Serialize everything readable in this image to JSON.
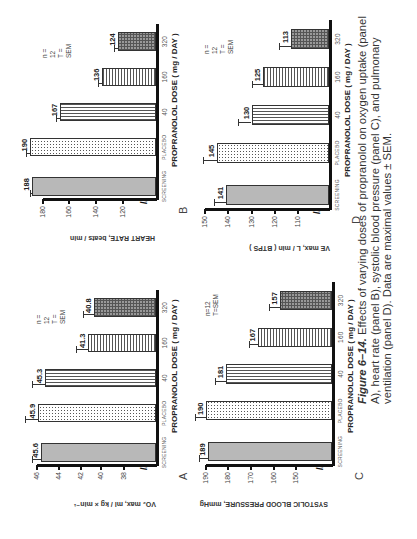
{
  "figure": {
    "caption_label": "Figure 6–14.",
    "caption_text": " Effects of varying doses of propranolol on oxygen uptake (panel A), heart rate (panel B), systolic blood pressure (panel C), and pulmonary ventilation (panel D). Data are maximal values ± SEM."
  },
  "chart_data": [
    {
      "panel": "A",
      "type": "bar",
      "title": "",
      "categories": [
        "SCREENING",
        "PLACEBO",
        "40",
        "160",
        "320"
      ],
      "values": [
        45.6,
        45.9,
        45.3,
        41.3,
        40.8
      ],
      "error_sem": [
        0.9,
        1.2,
        1.2,
        1.1,
        1.0
      ],
      "value_labels": [
        "45.6",
        "45.9",
        "45.3",
        "41.3",
        "40.8"
      ],
      "xlabel": "PROPRANOLOL DOSE ( mg / DAY )",
      "ylabel": "VO₂ max, ml / kg × min⁻¹",
      "yticks": [
        38,
        40,
        42,
        44,
        46
      ],
      "ylim": [
        35,
        46
      ],
      "axis_break": true,
      "legend": [
        "n = 12",
        "T = SEM"
      ]
    },
    {
      "panel": "B",
      "type": "bar",
      "title": "",
      "categories": [
        "SCREENING",
        "PLACEBO",
        "40",
        "160",
        "320"
      ],
      "values": [
        188,
        190,
        167,
        136,
        124
      ],
      "error_sem": [
        2,
        3,
        3,
        3,
        3
      ],
      "value_labels": [
        "188",
        "190",
        "167",
        "136",
        "124"
      ],
      "xlabel": "PROPRANOLOL DOSE ( mg / DAY )",
      "ylabel": "HEART RATE, beats / min",
      "yticks": [
        120,
        140,
        160,
        180
      ],
      "ylim": [
        95,
        180
      ],
      "axis_break": true,
      "legend": [
        "n = 12",
        "T = SEM"
      ]
    },
    {
      "panel": "C",
      "type": "bar",
      "title": "",
      "categories": [
        "SCREENING",
        "PLACEBO",
        "40",
        "160",
        "320"
      ],
      "values": [
        189,
        190,
        181,
        167,
        157
      ],
      "error_sem": [
        4,
        5,
        5,
        4,
        5
      ],
      "value_labels": [
        "189",
        "190",
        "181",
        "167",
        "157"
      ],
      "xlabel": "PROPRANOLOL DOSE ( mg / DAY )",
      "ylabel": "SYSTOLIC BLOOD PRESSURE, mmHg",
      "yticks": [
        150,
        160,
        170,
        180,
        190
      ],
      "ylim": [
        134,
        190
      ],
      "axis_break": true,
      "legend": [
        "n=12",
        "T=SEM"
      ]
    },
    {
      "panel": "D",
      "type": "bar",
      "title": "",
      "categories": [
        "SCREENING",
        "PLACEBO",
        "40",
        "160",
        "320"
      ],
      "values": [
        141,
        145,
        130,
        125,
        113
      ],
      "error_sem": [
        5,
        6,
        6,
        5,
        5
      ],
      "value_labels": [
        "141",
        "145",
        "130",
        "125",
        "113"
      ],
      "xlabel": "PROPRANOLOL DOSE ( mg / DAY )",
      "ylabel": "VE max, L / min ( BTPS )",
      "yticks": [
        110,
        120,
        130,
        140,
        150
      ],
      "ylim": [
        97,
        150
      ],
      "axis_break": true,
      "legend": [
        "n = 12",
        "T = SEM"
      ]
    }
  ],
  "layout": [
    {
      "x0": 73,
      "x1": 249,
      "base": 157,
      "ticks_px": [
        124,
        101,
        81,
        59,
        37
      ],
      "label_x": 78,
      "label_y": 206,
      "plabel_x": 73,
      "plabel_y": 225,
      "legend_x": 225,
      "legend_y": 35,
      "xlabel_x": 106,
      "ylabel_x": 52,
      "ylabel_y": 178
    },
    {
      "x0": 339,
      "x1": 515,
      "base": 157,
      "ticks_px": [
        123,
        96,
        69,
        43
      ],
      "label_x": 344,
      "label_y": 206,
      "plabel_x": 335,
      "plabel_y": 225,
      "legend_x": 491,
      "legend_y": 35,
      "xlabel_x": 372,
      "ylabel_x": 310,
      "ylabel_y": 178
    },
    {
      "x0": 73,
      "x1": 257,
      "base": 333,
      "ticks_px": [
        296,
        274,
        251,
        228,
        206
      ],
      "label_x": 78,
      "label_y": 206,
      "plabel_x": 73,
      "plabel_y": 400,
      "legend_x": 233,
      "legend_y": 205,
      "xlabel_x": 106,
      "ylabel_x": 52,
      "ylabel_y": 355
    },
    {
      "x0": 329,
      "x1": 519,
      "base": 330,
      "ticks_px": [
        298,
        275,
        252,
        228,
        205
      ],
      "label_x": 334,
      "label_y": 206,
      "plabel_x": 330,
      "plabel_y": 400,
      "legend_x": 493,
      "legend_y": 205,
      "xlabel_x": 362,
      "ylabel_x": 307,
      "ylabel_y": 352
    }
  ]
}
